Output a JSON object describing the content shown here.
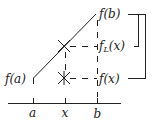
{
  "diagram": {
    "type": "linear-interpolation",
    "colors": {
      "ink": "#222222",
      "background": "#ffffff"
    },
    "axis": {
      "ticks": [
        {
          "label": "a"
        },
        {
          "label": "x"
        },
        {
          "label": "b"
        }
      ]
    },
    "points": {
      "fa": {
        "label": "f(a)"
      },
      "fb": {
        "label": "f(b)"
      },
      "fL": {
        "label_main": "f",
        "label_sub": "L",
        "label_arg": "(x)"
      },
      "fx": {
        "label": "f(x)"
      }
    },
    "markers": [
      "cross-interpolated",
      "cross-actual"
    ],
    "bracket": {
      "description": "outer bracket connects f(b) and f(x); inner bracket connects to f_L(x)"
    }
  }
}
